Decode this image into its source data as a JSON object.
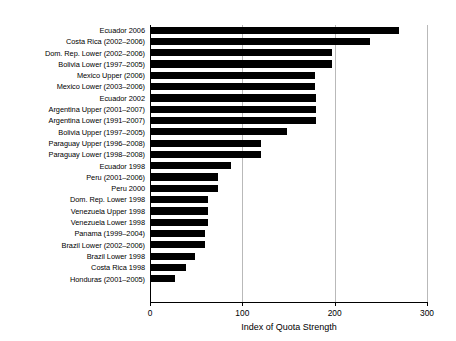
{
  "chart_data": {
    "type": "bar",
    "orientation": "horizontal",
    "title": "",
    "xlabel": "Index of Quota Strength",
    "ylabel": "",
    "xlim": [
      0,
      300
    ],
    "xticks": [
      0,
      100,
      200,
      300
    ],
    "xtick_labels": [
      "0",
      "100",
      "200",
      "300"
    ],
    "grid": "vertical",
    "legend": "none",
    "bar_color": "#000000",
    "categories": [
      "Ecuador 2006",
      "Costa Rica (2002–2006)",
      "Dom. Rep. Lower (2002–2006)",
      "Bolivia Lower (1997–2005)",
      "Mexico Upper (2006)",
      "Mexico Lower (2003–2006)",
      "Ecuador 2002",
      "Argentina Upper (2001–2007)",
      "Argentina Lower (1991–2007)",
      "Bolivia Upper (1997–2005)",
      "Paraguay Upper (1996–2008)",
      "Paraguay Lower (1998–2008)",
      "Ecuador 1998",
      "Peru (2001–2006)",
      "Peru 2000",
      "Dom. Rep. Lower 1998",
      "Venezuela Upper 1998",
      "Venezuela Lower 1998",
      "Panama (1999–2004)",
      "Brazil Lower (2002–2006)",
      "Brazil Lower 1998",
      "Costa Rica 1998",
      "Honduras (2001–2005)"
    ],
    "values": [
      270,
      238,
      197,
      197,
      179,
      179,
      180,
      180,
      180,
      148,
      120,
      120,
      88,
      74,
      74,
      63,
      63,
      63,
      60,
      60,
      49,
      39,
      27
    ]
  }
}
